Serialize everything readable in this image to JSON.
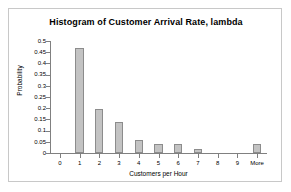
{
  "chart_data": {
    "type": "bar",
    "title": "Histogram of Customer Arrival Rate, lambda",
    "xlabel": "Customers per Hour",
    "ylabel": "Probability",
    "categories": [
      "0",
      "1",
      "2",
      "3",
      "4",
      "5",
      "6",
      "7",
      "8",
      "9",
      "More"
    ],
    "values": [
      0,
      0.47,
      0.195,
      0.14,
      0.06,
      0.04,
      0.04,
      0.02,
      0,
      0,
      0.04
    ],
    "ylim": [
      0,
      0.5
    ],
    "ytick_labels": [
      "0.5",
      "0.45",
      "0.4",
      "0.35",
      "0.3",
      "0.25",
      "0.2",
      "0.15",
      "0.1",
      "0.05",
      "0"
    ],
    "ytick_values": [
      0.5,
      0.45,
      0.4,
      0.35,
      0.3,
      0.25,
      0.2,
      0.15,
      0.1,
      0.05,
      0
    ],
    "grid": false,
    "legend": false,
    "bar_color": "#c3c3c3",
    "bar_border_color": "#8c8c8c",
    "axis_color": "#808080",
    "plot_background": "#ffffff",
    "frame_border_color": "#c8c8c8"
  }
}
